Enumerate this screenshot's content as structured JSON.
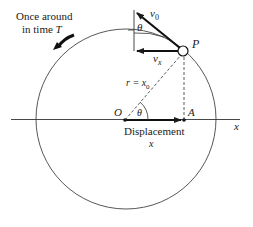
{
  "caption": {
    "line1": "Once around",
    "line2_prefix": "in time ",
    "line2_var": "T"
  },
  "labels": {
    "point_p": "P",
    "origin": "O",
    "point_a": "A",
    "axis_x": "x",
    "velocity": "v",
    "velocity_sub": "0",
    "vx": "v",
    "vx_sub": "x",
    "theta_top": "θ",
    "theta_origin": "θ",
    "radius_lhs": "r = x",
    "radius_sub": "0",
    "displacement": "Displacement",
    "displacement_var": "x"
  },
  "colors": {
    "line": "#1a1a1a",
    "circle": "#444444",
    "background": "#ffffff"
  }
}
